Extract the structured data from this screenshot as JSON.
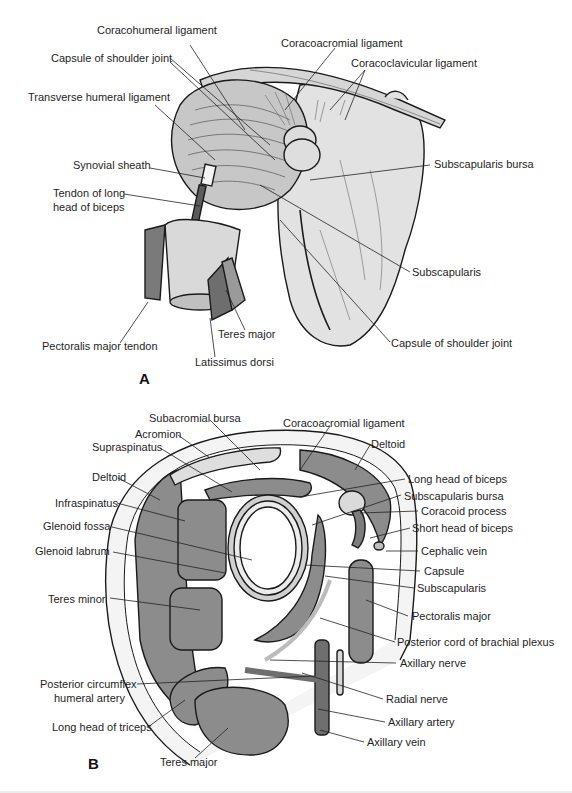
{
  "figure": {
    "panels": [
      {
        "id": "A",
        "letter": "A",
        "description": "Anterior view of shoulder joint with ligaments and tendons",
        "labels": [
          {
            "text": "Coracohumeral ligament",
            "x": 97,
            "y": 30
          },
          {
            "text": "Coracoacromial ligament",
            "x": 281,
            "y": 37
          },
          {
            "text": "Capsule of shoulder joint",
            "x": 51,
            "y": 52
          },
          {
            "text": "Coracoclavicular ligament",
            "x": 351,
            "y": 57
          },
          {
            "text": "Transverse humeral ligament",
            "x": 28,
            "y": 91
          },
          {
            "text": "Subscapularis bursa",
            "x": 434,
            "y": 158
          },
          {
            "text": "Synovial sheath",
            "x": 73,
            "y": 159
          },
          {
            "text": "Tendon of long",
            "x": 53,
            "y": 187
          },
          {
            "text": "head of biceps",
            "x": 53,
            "y": 201
          },
          {
            "text": "Subscapularis",
            "x": 412,
            "y": 266
          },
          {
            "text": "Pectoralis major tendon",
            "x": 42,
            "y": 340
          },
          {
            "text": "Teres major",
            "x": 218,
            "y": 328
          },
          {
            "text": "Capsule of shoulder joint",
            "x": 391,
            "y": 337
          },
          {
            "text": "Latissimus dorsi",
            "x": 195,
            "y": 356
          }
        ]
      },
      {
        "id": "B",
        "letter": "B",
        "description": "Transverse section through shoulder joint",
        "labels": [
          {
            "text": "Subacromial bursa",
            "x": 149,
            "y": 412
          },
          {
            "text": "Coracoacromial ligament",
            "x": 283,
            "y": 417
          },
          {
            "text": "Acromion",
            "x": 135,
            "y": 428
          },
          {
            "text": "Supraspinatus",
            "x": 92,
            "y": 441
          },
          {
            "text": "Deltoid",
            "x": 371,
            "y": 438
          },
          {
            "text": "Deltoid",
            "x": 92,
            "y": 471
          },
          {
            "text": "Long head of biceps",
            "x": 408,
            "y": 473
          },
          {
            "text": "Infraspinatus",
            "x": 55,
            "y": 497
          },
          {
            "text": "Subscapularis bursa",
            "x": 404,
            "y": 490
          },
          {
            "text": "Coracoid process",
            "x": 421,
            "y": 505
          },
          {
            "text": "Glenoid fossa",
            "x": 43,
            "y": 520
          },
          {
            "text": "Short head of biceps",
            "x": 412,
            "y": 522
          },
          {
            "text": "Glenoid labrum",
            "x": 35,
            "y": 545
          },
          {
            "text": "Cephalic vein",
            "x": 421,
            "y": 545
          },
          {
            "text": "Capsule",
            "x": 424,
            "y": 565
          },
          {
            "text": "Subscapularis",
            "x": 417,
            "y": 582
          },
          {
            "text": "Teres minor",
            "x": 48,
            "y": 593
          },
          {
            "text": "Pectoralis major",
            "x": 412,
            "y": 610
          },
          {
            "text": "Posterior cord of brachial plexus",
            "x": 397,
            "y": 636
          },
          {
            "text": "Axillary nerve",
            "x": 400,
            "y": 657
          },
          {
            "text": "Posterior circumflex",
            "x": 40,
            "y": 678
          },
          {
            "text": "humeral artery",
            "x": 54,
            "y": 692
          },
          {
            "text": "Radial nerve",
            "x": 386,
            "y": 693
          },
          {
            "text": "Long head of triceps",
            "x": 52,
            "y": 721
          },
          {
            "text": "Axillary artery",
            "x": 388,
            "y": 716
          },
          {
            "text": "Axillary vein",
            "x": 367,
            "y": 736
          },
          {
            "text": "Teres major",
            "x": 160,
            "y": 756
          }
        ]
      }
    ],
    "colors": {
      "background": "#ffffff",
      "text": "#1e1e1e",
      "outline": "#1a1a1a",
      "bone_fill": "#e4e4e4",
      "muscle_fill": "#8c8c8c",
      "light_muscle": "#b9b9b9",
      "leader": "#222222"
    }
  }
}
